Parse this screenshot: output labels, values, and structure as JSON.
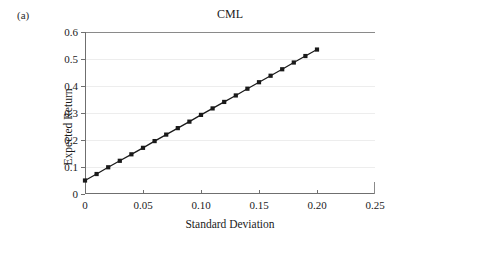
{
  "panel": {
    "label": "(a)"
  },
  "chart_data": {
    "type": "line",
    "title": "CML",
    "xlabel": "Standard Deviation",
    "ylabel": "Expected Return",
    "xlim": [
      0,
      0.25
    ],
    "ylim": [
      0,
      0.6
    ],
    "grid": true,
    "legend": "none",
    "marker": "square",
    "line_color": "#1a1a1a",
    "marker_color": "#1a1a1a",
    "grid_color": "#ededed",
    "axis_color": "#6f6f6f",
    "xticks": [
      "0",
      "0.05",
      "0.10",
      "0.15",
      "0.20",
      "0.25"
    ],
    "xtick_values": [
      0,
      0.05,
      0.1,
      0.15,
      0.2,
      0.25
    ],
    "yticks": [
      "0",
      "0.1",
      "0.2",
      "0.3",
      "0.4",
      "0.5",
      "0.6"
    ],
    "ytick_values": [
      0,
      0.1,
      0.2,
      0.3,
      0.4,
      0.5,
      0.6
    ],
    "series": [
      {
        "name": "CML",
        "x": [
          0,
          0.01,
          0.02,
          0.03,
          0.04,
          0.05,
          0.06,
          0.07,
          0.08,
          0.09,
          0.1,
          0.11,
          0.12,
          0.13,
          0.14,
          0.15,
          0.16,
          0.17,
          0.18,
          0.19,
          0.2
        ],
        "y": [
          0.05,
          0.074,
          0.099,
          0.123,
          0.147,
          0.171,
          0.196,
          0.22,
          0.244,
          0.268,
          0.293,
          0.317,
          0.341,
          0.365,
          0.39,
          0.414,
          0.438,
          0.462,
          0.487,
          0.511,
          0.535
        ]
      }
    ]
  }
}
